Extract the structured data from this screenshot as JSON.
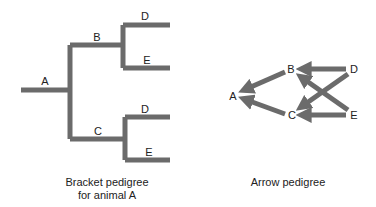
{
  "colors": {
    "line": "#6b6b6b",
    "text": "#222222",
    "background": "#ffffff"
  },
  "bracket": {
    "labels": {
      "A": "A",
      "B": "B",
      "C": "C",
      "D_top": "D",
      "E_top": "E",
      "D_bottom": "D",
      "E_bottom": "E"
    },
    "caption_line1": "Bracket pedigree",
    "caption_line2": "for animal A"
  },
  "arrow": {
    "labels": {
      "A": "A",
      "B": "B",
      "C": "C",
      "D": "D",
      "E": "E"
    },
    "edges": [
      {
        "from": "B",
        "to": "A"
      },
      {
        "from": "C",
        "to": "A"
      },
      {
        "from": "D",
        "to": "B"
      },
      {
        "from": "E",
        "to": "B"
      },
      {
        "from": "D",
        "to": "C"
      },
      {
        "from": "E",
        "to": "C"
      }
    ],
    "caption": "Arrow pedigree"
  }
}
